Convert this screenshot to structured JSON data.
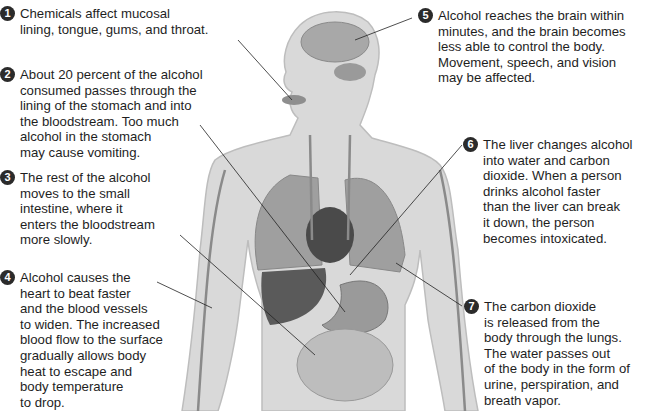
{
  "diagram": {
    "figure_labels": [
      "head-brain",
      "mouth",
      "lungs",
      "heart",
      "liver",
      "stomach",
      "small-intestine",
      "blood-vessels",
      "arm"
    ],
    "callouts": [
      {
        "number": "1",
        "text": "Chemicals affect mucosal\nlining, tongue, gums, and throat."
      },
      {
        "number": "2",
        "text": "About 20 percent of the alcohol\nconsumed passes through the\nlining of the stomach and into\nthe bloodstream. Too much\nalcohol in the stomach\nmay cause vomiting."
      },
      {
        "number": "3",
        "text": "The rest of the alcohol\nmoves to the small\nintestine, where it\nenters the bloodstream\nmore slowly."
      },
      {
        "number": "4",
        "text": "Alcohol causes the\nheart to beat faster\nand the blood vessels\nto widen. The increased\nblood flow to the surface\ngradually allows body\nheat to escape and\nbody temperature\nto drop."
      },
      {
        "number": "5",
        "text": "Alcohol reaches the brain within\nminutes, and the brain becomes\nless able to control the body.\nMovement, speech, and vision\nmay be affected."
      },
      {
        "number": "6",
        "text": "The liver changes alcohol\ninto water and carbon\ndioxide. When a person\ndrinks alcohol faster\nthan the liver can break\nit down, the person\nbecomes intoxicated."
      },
      {
        "number": "7",
        "text": "The carbon dioxide\nis released from the\nbody through the lungs.\nThe water passes out\nof the body in the form of\nurine, perspiration, and\nbreath vapor."
      }
    ]
  }
}
